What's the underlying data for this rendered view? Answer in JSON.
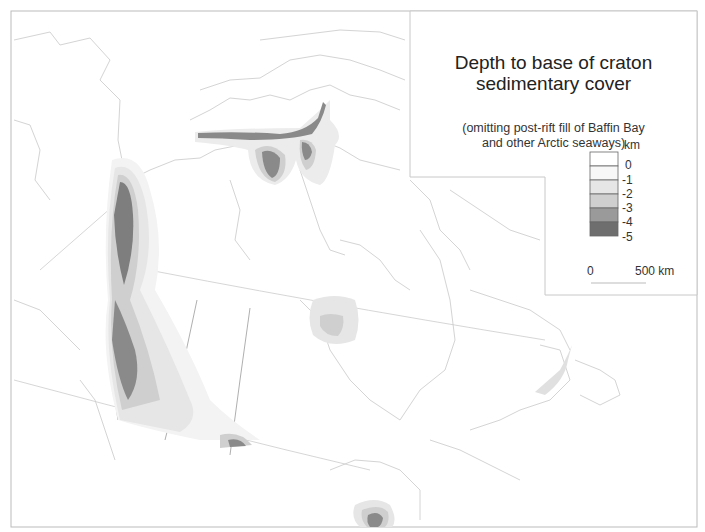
{
  "map": {
    "title_line1": "Depth to base of craton",
    "title_line2": "sedimentary cover",
    "subtitle_line1": "(omitting post-rift fill of Baffin Bay",
    "subtitle_line2": "and other Arctic seaways)"
  },
  "legend": {
    "unit": "km",
    "classes": [
      {
        "label": "0",
        "color": "#ffffff"
      },
      {
        "label": "-1",
        "color": "#f7f7f7"
      },
      {
        "label": "-2",
        "color": "#e6e6e6"
      },
      {
        "label": "-3",
        "color": "#cfcfcf"
      },
      {
        "label": "-4",
        "color": "#9a9a9a"
      },
      {
        "label": "-5",
        "color": "#6e6e6e"
      }
    ]
  },
  "scale_bar": {
    "start_label": "0",
    "end_label": "500 km"
  },
  "colors": {
    "outline": "#cfcfcf",
    "boundary": "#8c8c8c",
    "frame": "#b5b5b5"
  }
}
